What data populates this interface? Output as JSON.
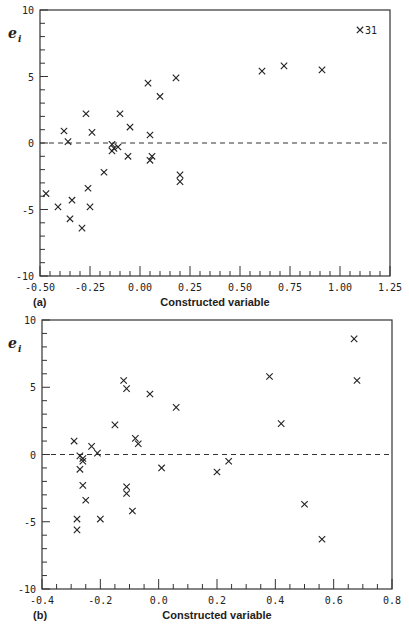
{
  "chart_data": [
    {
      "type": "scatter",
      "panel": "(a)",
      "title": "",
      "xlabel": "Constructed variable",
      "ylabel": "e_i",
      "xlim": [
        -0.5,
        1.25
      ],
      "ylim": [
        -10,
        10
      ],
      "xticks": [
        "-0.50",
        "-0.25",
        "0.00",
        "0.25",
        "0.50",
        "0.75",
        "1.00",
        "1.25"
      ],
      "yticks": [
        "-10",
        "-5",
        "0",
        "5",
        "10"
      ],
      "reference_line": {
        "y": 0,
        "style": "dashed"
      },
      "marker": "x",
      "annotations": [
        {
          "text": "31",
          "x": 1.1,
          "y": 8.5
        }
      ],
      "points": [
        {
          "x": 1.1,
          "y": 8.5
        },
        {
          "x": 0.61,
          "y": 5.4
        },
        {
          "x": 0.72,
          "y": 5.8
        },
        {
          "x": 0.91,
          "y": 5.5
        },
        {
          "x": 0.04,
          "y": 4.5
        },
        {
          "x": 0.18,
          "y": 4.9
        },
        {
          "x": 0.1,
          "y": 3.5
        },
        {
          "x": -0.27,
          "y": 2.2
        },
        {
          "x": -0.1,
          "y": 2.2
        },
        {
          "x": -0.05,
          "y": 1.2
        },
        {
          "x": -0.38,
          "y": 0.9
        },
        {
          "x": -0.24,
          "y": 0.8
        },
        {
          "x": -0.36,
          "y": 0.1
        },
        {
          "x": 0.05,
          "y": 0.6
        },
        {
          "x": -0.14,
          "y": -0.1
        },
        {
          "x": -0.13,
          "y": -0.4
        },
        {
          "x": -0.14,
          "y": -0.6
        },
        {
          "x": -0.11,
          "y": -0.3
        },
        {
          "x": -0.06,
          "y": -1.0
        },
        {
          "x": 0.05,
          "y": -1.3
        },
        {
          "x": 0.06,
          "y": -1.0
        },
        {
          "x": -0.18,
          "y": -2.2
        },
        {
          "x": 0.2,
          "y": -2.4
        },
        {
          "x": 0.2,
          "y": -2.9
        },
        {
          "x": -0.47,
          "y": -3.8
        },
        {
          "x": -0.26,
          "y": -3.4
        },
        {
          "x": -0.34,
          "y": -4.3
        },
        {
          "x": -0.41,
          "y": -4.8
        },
        {
          "x": -0.25,
          "y": -4.8
        },
        {
          "x": -0.35,
          "y": -5.7
        },
        {
          "x": -0.29,
          "y": -6.4
        }
      ]
    },
    {
      "type": "scatter",
      "panel": "(b)",
      "title": "",
      "xlabel": "Constructed variable",
      "ylabel": "e_i",
      "xlim": [
        -0.4,
        0.8
      ],
      "ylim": [
        -10,
        10
      ],
      "xticks": [
        "-0.4",
        "-0.2",
        "0.0",
        "0.2",
        "0.4",
        "0.6",
        "0.8"
      ],
      "yticks": [
        "-10",
        "-5",
        "0",
        "5",
        "10"
      ],
      "reference_line": {
        "y": 0,
        "style": "dashed"
      },
      "marker": "x",
      "points": [
        {
          "x": 0.67,
          "y": 8.6
        },
        {
          "x": 0.68,
          "y": 5.5
        },
        {
          "x": 0.38,
          "y": 5.8
        },
        {
          "x": 0.42,
          "y": 2.3
        },
        {
          "x": -0.12,
          "y": 5.5
        },
        {
          "x": -0.11,
          "y": 4.9
        },
        {
          "x": -0.03,
          "y": 4.5
        },
        {
          "x": 0.06,
          "y": 3.5
        },
        {
          "x": -0.15,
          "y": 2.2
        },
        {
          "x": -0.08,
          "y": 1.2
        },
        {
          "x": -0.07,
          "y": 0.8
        },
        {
          "x": -0.29,
          "y": 1.0
        },
        {
          "x": -0.23,
          "y": 0.6
        },
        {
          "x": -0.21,
          "y": 0.1
        },
        {
          "x": -0.27,
          "y": -0.1
        },
        {
          "x": -0.26,
          "y": -0.3
        },
        {
          "x": -0.26,
          "y": -0.5
        },
        {
          "x": -0.27,
          "y": -1.1
        },
        {
          "x": 0.01,
          "y": -1.0
        },
        {
          "x": 0.2,
          "y": -1.3
        },
        {
          "x": 0.24,
          "y": -0.5
        },
        {
          "x": -0.26,
          "y": -2.3
        },
        {
          "x": -0.11,
          "y": -2.4
        },
        {
          "x": -0.11,
          "y": -2.9
        },
        {
          "x": -0.25,
          "y": -3.4
        },
        {
          "x": -0.09,
          "y": -4.2
        },
        {
          "x": 0.5,
          "y": -3.7
        },
        {
          "x": -0.28,
          "y": -4.8
        },
        {
          "x": -0.2,
          "y": -4.8
        },
        {
          "x": -0.28,
          "y": -5.6
        },
        {
          "x": 0.56,
          "y": -6.3
        }
      ]
    }
  ]
}
